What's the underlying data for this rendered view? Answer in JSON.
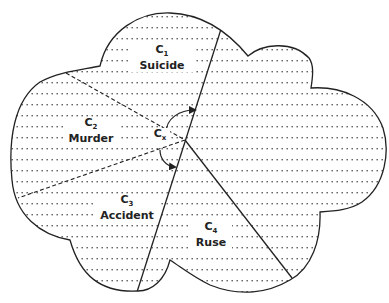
{
  "diagram": {
    "type": "partitioned-cloud",
    "center_label": {
      "main": "C",
      "sub": "x"
    },
    "regions": [
      {
        "id": "c1",
        "symbol": "C",
        "sub": "1",
        "name": "Suicide"
      },
      {
        "id": "c2",
        "symbol": "C",
        "sub": "2",
        "name": "Murder"
      },
      {
        "id": "c3",
        "symbol": "C",
        "sub": "3",
        "name": "Accident"
      },
      {
        "id": "c4",
        "symbol": "C",
        "sub": "4",
        "name": "Ruse"
      }
    ],
    "colors": {
      "stroke": "#222222",
      "fill": "#ffffff",
      "dots": "#555555"
    }
  }
}
